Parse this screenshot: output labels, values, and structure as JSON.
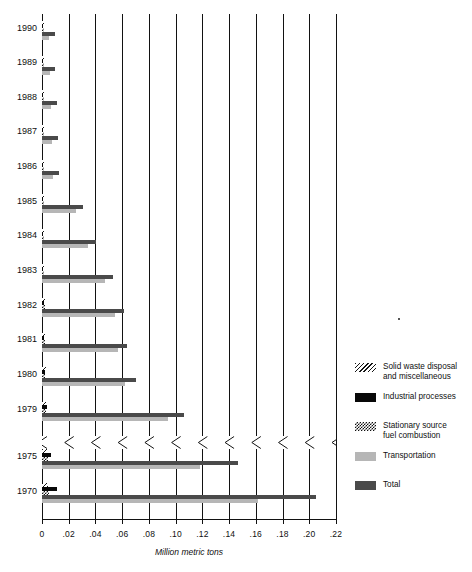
{
  "chart_data": {
    "type": "bar",
    "orientation": "horizontal",
    "title": "",
    "xlabel": "Million metric tons",
    "ylabel": "",
    "xlim": [
      0,
      0.22
    ],
    "xticks": [
      0,
      0.02,
      0.04,
      0.06,
      0.08,
      0.1,
      0.12,
      0.14,
      0.16,
      0.18,
      0.2,
      0.22
    ],
    "xticklabels": [
      "0",
      ".02",
      ".04",
      ".06",
      ".08",
      ".10",
      ".12",
      ".14",
      ".16",
      ".18",
      ".20",
      ".22"
    ],
    "grid": true,
    "legend_position": "right",
    "axis_break": {
      "between": [
        "1979",
        "1975"
      ],
      "style": "zigzag"
    },
    "categories": [
      "1990",
      "1989",
      "1988",
      "1987",
      "1986",
      "1985",
      "1984",
      "1983",
      "1982",
      "1981",
      "1980",
      "1979",
      "1975",
      "1970"
    ],
    "series": [
      {
        "name": "Solid waste disposal and miscellaneous",
        "pattern": "diagonal-hatch",
        "values": [
          0.0015,
          0.0015,
          0.0015,
          0.0015,
          0.0015,
          0.0015,
          0.0015,
          0.0015,
          0.002,
          0.002,
          0.003,
          0.003,
          0.004,
          0.0045
        ]
      },
      {
        "name": "Industrial processes",
        "color": "#080808",
        "values": [
          0.001,
          0.001,
          0.001,
          0.001,
          0.001,
          0.001,
          0.001,
          0.001,
          0.0015,
          0.0015,
          0.002,
          0.0035,
          0.0065,
          0.011
        ]
      },
      {
        "name": "Stationary source fuel combustion",
        "pattern": "checkerboard",
        "values": [
          0.0015,
          0.0015,
          0.0015,
          0.0015,
          0.0015,
          0.0015,
          0.0015,
          0.0015,
          0.002,
          0.002,
          0.0025,
          0.003,
          0.0045,
          0.005
        ]
      },
      {
        "name": "Transportation",
        "color": "#b6b6b6",
        "values": [
          0.0055,
          0.006,
          0.007,
          0.0075,
          0.0085,
          0.0255,
          0.0345,
          0.0475,
          0.0545,
          0.057,
          0.062,
          0.0945,
          0.118,
          0.162
        ]
      },
      {
        "name": "Total",
        "color": "#4a4a4a",
        "values": [
          0.0095,
          0.01,
          0.011,
          0.012,
          0.013,
          0.0305,
          0.0405,
          0.0535,
          0.061,
          0.0635,
          0.0705,
          0.106,
          0.147,
          0.205
        ]
      }
    ]
  },
  "legend": {
    "items": [
      {
        "label_line1": "Solid waste disposal",
        "label_line2": "and miscellaneous",
        "swatch": "diagonal-hatch"
      },
      {
        "label_line1": "Industrial processes",
        "label_line2": "",
        "swatch": "solid-black"
      },
      {
        "label_line1": "Stationary source",
        "label_line2": "fuel combustion",
        "swatch": "checkerboard"
      },
      {
        "label_line1": "Transportation",
        "label_line2": "",
        "swatch": "light-gray"
      },
      {
        "label_line1": "Total",
        "label_line2": "",
        "swatch": "dark-gray"
      }
    ]
  },
  "colors": {
    "total": "#4a4a4a",
    "transportation": "#b6b6b6",
    "industrial": "#080808",
    "axis": "#121212",
    "background": "#ffffff"
  }
}
